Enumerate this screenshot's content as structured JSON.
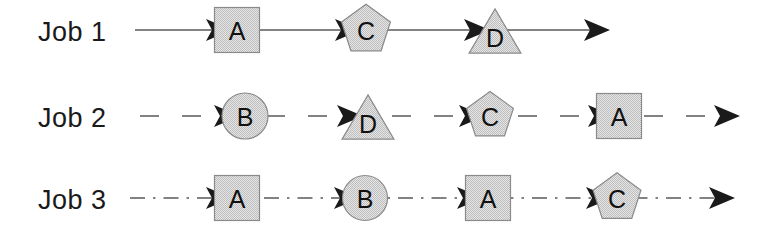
{
  "diagram": {
    "canvas": {
      "width": 759,
      "height": 236,
      "background": "#ffffff"
    },
    "palette": {
      "shape_fill": "#d6d6d6",
      "shape_stroke": "#8a8a8a",
      "line_color": "#5a5a5a",
      "arrow_color": "#1a1a1a",
      "label_color": "#1a1a1a"
    },
    "shape_legend": [
      {
        "machine": "A",
        "shape": "square"
      },
      {
        "machine": "B",
        "shape": "circle"
      },
      {
        "machine": "C",
        "shape": "pentagon"
      },
      {
        "machine": "D",
        "shape": "triangle"
      }
    ],
    "rows": [
      {
        "id": "job-1",
        "label": "Job 1",
        "line_style": "solid",
        "label_x": 38,
        "label_baseline": 41,
        "center_y": 30,
        "line_start_x": 135,
        "line_end_x": 597,
        "sequence": [
          "A",
          "C",
          "D"
        ],
        "nodes": [
          {
            "machine": "A",
            "shape": "square",
            "cx": 237,
            "cy": 30,
            "size": 45
          },
          {
            "machine": "C",
            "shape": "pentagon",
            "cx": 366,
            "cy": 30,
            "size": 48
          },
          {
            "machine": "D",
            "shape": "triangle",
            "cx": 495,
            "cy": 31,
            "size": 48
          }
        ],
        "arrows_x": [
          206,
          335,
          464,
          584
        ]
      },
      {
        "id": "job-2",
        "label": "Job 2",
        "line_style": "dashed",
        "label_x": 38,
        "label_baseline": 127,
        "center_y": 116,
        "line_start_x": 140,
        "line_end_x": 727,
        "sequence": [
          "B",
          "D",
          "C",
          "A"
        ],
        "nodes": [
          {
            "machine": "B",
            "shape": "circle",
            "cx": 245,
            "cy": 116,
            "size": 46
          },
          {
            "machine": "D",
            "shape": "triangle",
            "cx": 368,
            "cy": 117,
            "size": 48
          },
          {
            "machine": "C",
            "shape": "pentagon",
            "cx": 490,
            "cy": 116,
            "size": 46
          },
          {
            "machine": "A",
            "shape": "square",
            "cx": 619,
            "cy": 116,
            "size": 45
          }
        ],
        "arrows_x": [
          214,
          337,
          459,
          588,
          714
        ]
      },
      {
        "id": "job-3",
        "label": "Job 3",
        "line_style": "dash-dot",
        "label_x": 38,
        "label_baseline": 209,
        "center_y": 198,
        "line_start_x": 130,
        "line_end_x": 722,
        "sequence": [
          "A",
          "B",
          "A",
          "C"
        ],
        "nodes": [
          {
            "machine": "A",
            "shape": "square",
            "cx": 237,
            "cy": 198,
            "size": 45
          },
          {
            "machine": "B",
            "shape": "circle",
            "cx": 365,
            "cy": 198,
            "size": 45
          },
          {
            "machine": "A",
            "shape": "square",
            "cx": 488,
            "cy": 198,
            "size": 45
          },
          {
            "machine": "C",
            "shape": "pentagon",
            "cx": 617,
            "cy": 198,
            "size": 47
          }
        ],
        "arrows_x": [
          206,
          334,
          457,
          586,
          709
        ]
      }
    ]
  }
}
